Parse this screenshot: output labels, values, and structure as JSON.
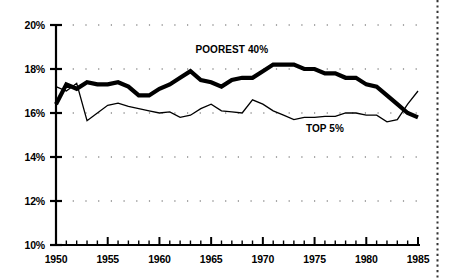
{
  "chart_data": {
    "type": "line",
    "title": "",
    "subtitle": "",
    "xlabel": "",
    "ylabel": "",
    "xlim": [
      1950,
      1985
    ],
    "ylim": [
      10,
      20
    ],
    "ytick_labels": [
      "10%",
      "12%",
      "14%",
      "16%",
      "18%",
      "20%"
    ],
    "yticks": [
      10,
      12,
      14,
      16,
      18,
      20
    ],
    "xtick_labels": [
      "1950",
      "1955",
      "1960",
      "1965",
      "1970",
      "1975",
      "1980",
      "1985"
    ],
    "xticks": [
      1950,
      1955,
      1960,
      1965,
      1970,
      1975,
      1980,
      1985
    ],
    "grid": "dotted-horizontal",
    "legend_position": "inline-annotations",
    "x": [
      1950,
      1951,
      1952,
      1953,
      1954,
      1955,
      1956,
      1957,
      1958,
      1959,
      1960,
      1961,
      1962,
      1963,
      1964,
      1965,
      1966,
      1967,
      1968,
      1969,
      1970,
      1971,
      1972,
      1973,
      1974,
      1975,
      1976,
      1977,
      1978,
      1979,
      1980,
      1981,
      1982,
      1983,
      1984,
      1985
    ],
    "series": [
      {
        "name": "POOREST 40%",
        "style": "thick",
        "color": "#000000",
        "label_x": 1967.0,
        "label_y": 18.75,
        "values": [
          16.4,
          17.3,
          17.1,
          17.4,
          17.3,
          17.3,
          17.4,
          17.2,
          16.8,
          16.8,
          17.1,
          17.3,
          17.6,
          17.9,
          17.5,
          17.4,
          17.2,
          17.5,
          17.6,
          17.6,
          17.9,
          18.2,
          18.2,
          18.2,
          18.0,
          18.0,
          17.8,
          17.8,
          17.6,
          17.6,
          17.3,
          17.2,
          16.8,
          16.4,
          16.0,
          15.8
        ]
      },
      {
        "name": "TOP 5%",
        "style": "thin",
        "color": "#000000",
        "label_x": 1976.0,
        "label_y": 15.15,
        "values": [
          17.2,
          17.0,
          17.35,
          15.65,
          16.0,
          16.35,
          16.45,
          16.3,
          16.2,
          16.1,
          16.0,
          16.05,
          15.8,
          15.9,
          16.2,
          16.4,
          16.1,
          16.05,
          16.0,
          16.6,
          16.4,
          16.1,
          15.9,
          15.7,
          15.8,
          15.8,
          15.85,
          15.85,
          16.0,
          16.0,
          15.9,
          15.9,
          15.6,
          15.7,
          16.4,
          17.0
        ]
      }
    ],
    "annotations": [
      {
        "text": "POOREST 40%",
        "x": 1967.0,
        "y": 18.75
      },
      {
        "text": "TOP 5%",
        "x": 1976.0,
        "y": 15.15
      }
    ],
    "page_border": {
      "type": "dotted-vertical-rule",
      "position": "right-edge"
    }
  },
  "render": {
    "plot": {
      "left": 56,
      "right": 418,
      "top": 25,
      "bottom": 245
    },
    "colors": {
      "ink": "#000000",
      "background": "#ffffff",
      "grid": "#555555"
    }
  }
}
